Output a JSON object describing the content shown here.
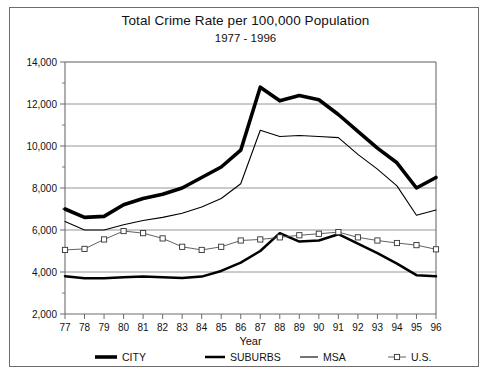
{
  "chart_data": {
    "type": "line",
    "title": "Total Crime Rate per 100,000 Population",
    "subtitle": "1977 - 1996",
    "xlabel": "Year",
    "ylabel": "",
    "grid": true,
    "legend_position": "bottom",
    "xlim": [
      77,
      96
    ],
    "ylim": [
      2000,
      14000
    ],
    "ytick_step": 2000,
    "yminor_step": 1000,
    "categories": [
      "77",
      "78",
      "79",
      "80",
      "81",
      "82",
      "83",
      "84",
      "85",
      "86",
      "87",
      "88",
      "89",
      "90",
      "91",
      "92",
      "93",
      "94",
      "95",
      "96"
    ],
    "ytick_labels": [
      "2,000",
      "4,000",
      "6,000",
      "8,000",
      "10,000",
      "12,000",
      "14,000"
    ],
    "ytick_values": [
      2000,
      4000,
      6000,
      8000,
      10000,
      12000,
      14000
    ],
    "series": [
      {
        "name": "CITY",
        "style": "thick-solid",
        "marker": "none",
        "color": "#000000",
        "values": [
          7000,
          6600,
          6650,
          7200,
          7500,
          7700,
          8000,
          8500,
          9000,
          9800,
          12800,
          12150,
          12400,
          12200,
          11500,
          10700,
          9900,
          9200,
          8000,
          8500
        ]
      },
      {
        "name": "SUBURBS",
        "style": "medium-solid",
        "marker": "none",
        "color": "#000000",
        "values": [
          3800,
          3700,
          3700,
          3750,
          3780,
          3750,
          3720,
          3780,
          4050,
          4450,
          5000,
          5850,
          5450,
          5500,
          5800,
          5350,
          4900,
          4400,
          3850,
          3800
        ]
      },
      {
        "name": "MSA",
        "style": "thin-solid",
        "marker": "none",
        "color": "#000000",
        "values": [
          6400,
          6000,
          6000,
          6250,
          6450,
          6600,
          6800,
          7100,
          7500,
          8200,
          10750,
          10450,
          10500,
          10450,
          10400,
          9600,
          8900,
          8100,
          6700,
          6950
        ]
      },
      {
        "name": "U.S.",
        "style": "thin-marker",
        "marker": "square",
        "color": "#444444",
        "values": [
          5050,
          5100,
          5550,
          5950,
          5850,
          5600,
          5200,
          5050,
          5200,
          5500,
          5550,
          5650,
          5750,
          5820,
          5900,
          5650,
          5500,
          5380,
          5280,
          5080
        ]
      }
    ]
  },
  "legend": {
    "items": [
      {
        "label": "CITY"
      },
      {
        "label": "SUBURBS"
      },
      {
        "label": "MSA"
      },
      {
        "label": "U.S."
      }
    ]
  }
}
